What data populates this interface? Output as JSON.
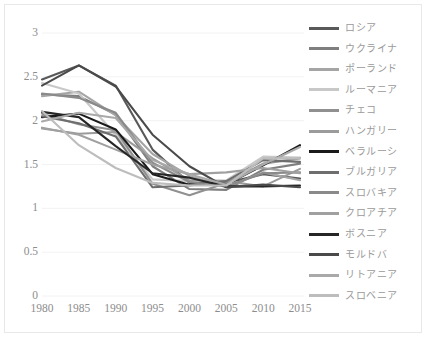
{
  "chart_data": {
    "type": "line",
    "title": "",
    "subtitle": "",
    "xlabel": "",
    "ylabel": "",
    "x": [
      1980,
      1985,
      1990,
      1995,
      2000,
      2005,
      2010,
      2015
    ],
    "xtick_labels": [
      "1980",
      "1985",
      "1990",
      "1995",
      "2000",
      "2005",
      "2010",
      "2015"
    ],
    "ytick_labels": [
      "0",
      "0.5",
      "1",
      "1.5",
      "2",
      "2.5",
      "3"
    ],
    "ytick_values": [
      0,
      0.5,
      1,
      1.5,
      2,
      2.5,
      3
    ],
    "ylim": [
      0,
      3
    ],
    "xlim": [
      1980,
      2015
    ],
    "grid": "horizontal",
    "legend_position": "right",
    "series": [
      {
        "name": "ロシア",
        "color": "#595959",
        "values": [
          2.47,
          2.63,
          2.4,
          1.67,
          1.29,
          1.29,
          1.39,
          1.34
        ]
      },
      {
        "name": "ウクライナ",
        "color": "#7f7f7f",
        "values": [
          2.3,
          2.28,
          2.07,
          1.48,
          1.22,
          1.21,
          1.44,
          1.51
        ]
      },
      {
        "name": "ポーランド",
        "color": "#a5a5a5",
        "values": [
          2.28,
          2.33,
          2.06,
          1.62,
          1.37,
          1.24,
          1.41,
          1.32
        ]
      },
      {
        "name": "ルーマニア",
        "color": "#c8c8c8",
        "values": [
          2.43,
          2.31,
          1.84,
          1.33,
          1.31,
          1.32,
          1.59,
          1.58
        ]
      },
      {
        "name": "チェコ",
        "color": "#909090",
        "values": [
          2.08,
          1.96,
          1.89,
          1.28,
          1.15,
          1.29,
          1.51,
          1.57
        ]
      },
      {
        "name": "ハンガリー",
        "color": "#9b9b9b",
        "values": [
          1.91,
          1.85,
          1.87,
          1.57,
          1.32,
          1.31,
          1.25,
          1.45
        ]
      },
      {
        "name": "ベラルーシ",
        "color": "#1a1a1a",
        "values": [
          2.04,
          2.08,
          1.9,
          1.39,
          1.27,
          1.27,
          1.49,
          1.72
        ]
      },
      {
        "name": "ブルガリア",
        "color": "#6e6e6e",
        "values": [
          2.05,
          1.97,
          1.82,
          1.24,
          1.26,
          1.31,
          1.55,
          1.53
        ]
      },
      {
        "name": "スロバキア",
        "color": "#8a8a8a",
        "values": [
          2.31,
          2.26,
          2.09,
          1.52,
          1.3,
          1.25,
          1.4,
          1.41
        ]
      },
      {
        "name": "クロアチア",
        "color": "#a0a0a0",
        "values": [
          1.92,
          1.84,
          1.67,
          1.5,
          1.39,
          1.41,
          1.46,
          1.4
        ]
      },
      {
        "name": "ボスニア",
        "color": "#262626",
        "values": [
          2.1,
          2.04,
          1.71,
          1.4,
          1.35,
          1.25,
          1.25,
          1.26
        ]
      },
      {
        "name": "モルドバ",
        "color": "#4a4a4a",
        "values": [
          2.4,
          2.63,
          2.39,
          1.84,
          1.48,
          1.24,
          1.27,
          1.24
        ]
      },
      {
        "name": "リトアニア",
        "color": "#a9a9a9",
        "values": [
          1.99,
          2.09,
          2.03,
          1.55,
          1.39,
          1.27,
          1.5,
          1.7
        ]
      },
      {
        "name": "スロベニア",
        "color": "#bdbdbd",
        "values": [
          2.11,
          1.72,
          1.46,
          1.29,
          1.26,
          1.26,
          1.57,
          1.57
        ]
      }
    ]
  },
  "legend": {
    "items": [
      {
        "label": "ロシア"
      },
      {
        "label": "ウクライナ"
      },
      {
        "label": "ポーランド"
      },
      {
        "label": "ルーマニア"
      },
      {
        "label": "チェコ"
      },
      {
        "label": "ハンガリー"
      },
      {
        "label": "ベラルーシ"
      },
      {
        "label": "ブルガリア"
      },
      {
        "label": "スロバキア"
      },
      {
        "label": "クロアチア"
      },
      {
        "label": "ボスニア"
      },
      {
        "label": "モルドバ"
      },
      {
        "label": "リトアニア"
      },
      {
        "label": "スロベニア"
      }
    ]
  },
  "style": {
    "background": "#ffffff",
    "gridline_color": "#f2f2f2",
    "axis_text_color": "#8d8d8d",
    "legend_text_color": "#9a9a9a",
    "border_color": "#e8e8e8"
  }
}
